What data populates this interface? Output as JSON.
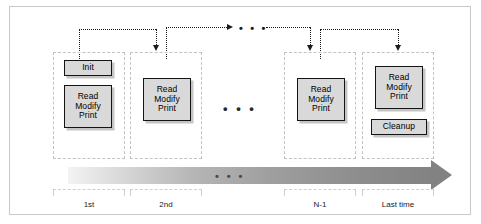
{
  "figure": {
    "background": "#ffffff",
    "frame_color": "#c9c9c9"
  },
  "colors": {
    "box_fill": "#d9d9d9",
    "box_border": "#141414",
    "column_border": "#c2c2c2",
    "wire": "#1b1b1b",
    "arrow_start": "#f3f3f3",
    "arrow_end": "#828282",
    "bracket": "#cfcfcf"
  },
  "columns": [
    {
      "id": "first",
      "axis_label": "1st",
      "boxes": [
        {
          "name": "init",
          "lines": [
            "Init"
          ]
        },
        {
          "name": "read-modify-print",
          "lines": [
            "Read",
            "Modify",
            "Print"
          ]
        }
      ]
    },
    {
      "id": "second",
      "axis_label": "2nd",
      "boxes": [
        {
          "name": "read-modify-print",
          "lines": [
            "Read",
            "Modify",
            "Print"
          ]
        }
      ]
    },
    {
      "id": "n-minus-1",
      "axis_label": "N-1",
      "boxes": [
        {
          "name": "read-modify-print",
          "lines": [
            "Read",
            "Modify",
            "Print"
          ]
        }
      ]
    },
    {
      "id": "last",
      "axis_label": "Last time",
      "boxes": [
        {
          "name": "read-modify-print",
          "lines": [
            "Read",
            "Modify",
            "Print"
          ]
        },
        {
          "name": "cleanup",
          "lines": [
            "Cleanup"
          ]
        }
      ]
    }
  ],
  "boxes": {
    "init": "Init",
    "cleanup": "Cleanup",
    "read": "Read",
    "modify": "Modify",
    "print": "Print"
  },
  "ellipses": {
    "top_wire": "• • •",
    "between_columns": "• • •",
    "time_bar": "• • •"
  },
  "axis": {
    "labels": [
      "1st",
      "2nd",
      "N-1",
      "Last time"
    ],
    "direction": "left-to-right time"
  }
}
